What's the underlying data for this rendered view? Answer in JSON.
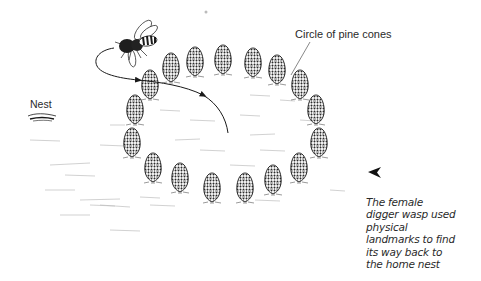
{
  "diagram": {
    "labels": {
      "cones": "Circle of pine cones",
      "nest": "Nest"
    },
    "caption": {
      "lines": [
        "The female",
        "digger wasp used",
        "physical",
        "landmarks to find",
        "its way back to",
        "the home nest"
      ]
    },
    "colors": {
      "ink": "#1a1a1a",
      "text": "#2a2a2a",
      "ground": "#bdbdbd",
      "background": "#ffffff"
    },
    "elements": {
      "pine_cone_count": 17,
      "wasp": "digger wasp in flight",
      "flight_path": "curved arrow looping from wasp through the circle"
    }
  }
}
